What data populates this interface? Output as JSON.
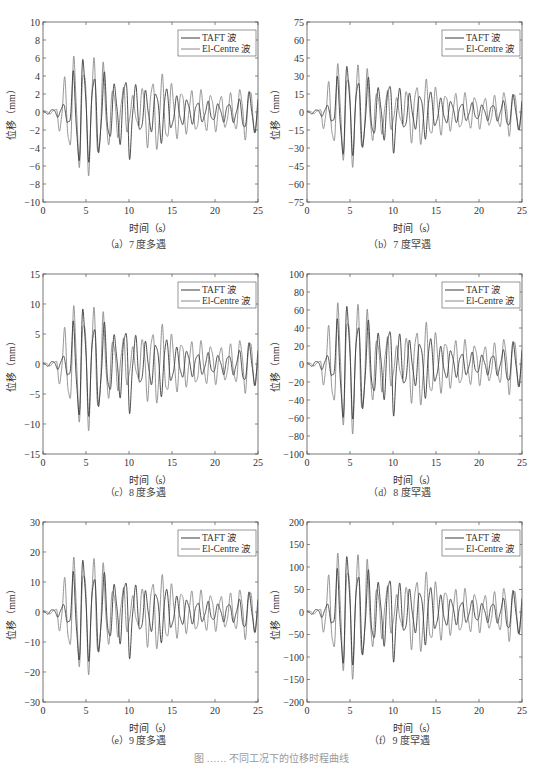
{
  "figure": {
    "caption_partial": "图 ……  不同工况下的位移时程曲线"
  },
  "colors": {
    "taft": "#3a3a3a",
    "elcentro": "#8a8a8a",
    "axis": "#555555",
    "text": "#333333"
  },
  "chart_data": [
    {
      "id": "a",
      "type": "line",
      "caption": "（a）7 度多遇",
      "xlabel": "时间（s）",
      "ylabel": "位移（mm）",
      "xlim": [
        0,
        25
      ],
      "ylim": [
        -10,
        10
      ],
      "xticks": [
        0,
        5,
        10,
        15,
        20,
        25
      ],
      "yticks": [
        -10,
        -8,
        -6,
        -4,
        -2,
        0,
        2,
        4,
        6,
        8,
        10
      ],
      "legend": [
        "TAFT 波",
        "El-Centre 波"
      ],
      "legend_position": "upper right",
      "grid": false,
      "scale": 8.3
    },
    {
      "id": "b",
      "type": "line",
      "caption": "（b）7 度罕遇",
      "xlabel": "时间（s）",
      "ylabel": "位移（mm）",
      "xlim": [
        0,
        25
      ],
      "ylim": [
        -75,
        75
      ],
      "xticks": [
        0,
        5,
        10,
        15,
        20,
        25
      ],
      "yticks": [
        -75,
        -60,
        -45,
        -30,
        -15,
        0,
        15,
        30,
        45,
        60,
        75
      ],
      "legend": [
        "TAFT 波",
        "El-Centre 波"
      ],
      "legend_position": "upper right",
      "grid": false,
      "scale": 54
    },
    {
      "id": "c",
      "type": "line",
      "caption": "（c）8 度多遇",
      "xlabel": "时间（s）",
      "ylabel": "位移（mm）",
      "xlim": [
        0,
        25
      ],
      "ylim": [
        -15,
        15
      ],
      "xticks": [
        0,
        5,
        10,
        15,
        20,
        25
      ],
      "yticks": [
        -15,
        -10,
        -5,
        0,
        5,
        10,
        15
      ],
      "legend": [
        "TAFT 波",
        "El-Centre 波"
      ],
      "legend_position": "upper right",
      "grid": false,
      "scale": 13
    },
    {
      "id": "d",
      "type": "line",
      "caption": "（d）8 度罕遇",
      "xlabel": "时间（s）",
      "ylabel": "位移（mm）",
      "xlim": [
        0,
        25
      ],
      "ylim": [
        -100,
        100
      ],
      "xticks": [
        0,
        5,
        10,
        15,
        20,
        25
      ],
      "yticks": [
        -100,
        -80,
        -60,
        -40,
        -20,
        0,
        20,
        40,
        60,
        80,
        100
      ],
      "legend": [
        "TAFT 波",
        "El-Centre 波"
      ],
      "legend_position": "upper right",
      "grid": false,
      "scale": 91
    },
    {
      "id": "e",
      "type": "line",
      "caption": "（e）9 度多遇",
      "xlabel": "时间（s）",
      "ylabel": "位移（mm）",
      "xlim": [
        0,
        25
      ],
      "ylim": [
        -30,
        30
      ],
      "xticks": [
        0,
        5,
        10,
        15,
        20,
        25
      ],
      "yticks": [
        -30,
        -20,
        -10,
        0,
        10,
        20,
        30
      ],
      "legend": [
        "TAFT 波",
        "El-Centre 波"
      ],
      "legend_position": "upper right",
      "grid": false,
      "scale": 24.5
    },
    {
      "id": "f",
      "type": "line",
      "caption": "（f）9 度罕遇",
      "xlabel": "时间（s）",
      "ylabel": "位移（mm）",
      "xlim": [
        0,
        25
      ],
      "ylim": [
        -200,
        200
      ],
      "xticks": [
        0,
        5,
        10,
        15,
        20,
        25
      ],
      "yticks": [
        -200,
        -150,
        -100,
        -50,
        0,
        50,
        100,
        150,
        200
      ],
      "legend": [
        "TAFT 波",
        "El-Centre 波"
      ],
      "legend_position": "upper right",
      "grid": false,
      "scale": 175
    }
  ],
  "series_shape": {
    "note": "normalized displacement envelopes (peak = 1) shared by all panels, scaled by chart_data[i].scale",
    "x": [
      0,
      0.5,
      1,
      1.5,
      2,
      2.5,
      3,
      3.5,
      4,
      4.5,
      5,
      5.5,
      6,
      6.5,
      7,
      7.5,
      8,
      8.5,
      9,
      9.5,
      10,
      10.5,
      11,
      11.5,
      12,
      12.5,
      13,
      13.5,
      14,
      14.5,
      15,
      15.5,
      16,
      16.5,
      17,
      17.5,
      18,
      18.5,
      19,
      19.5,
      20,
      20.5,
      21,
      21.5,
      22,
      22.5,
      23,
      23.5,
      24,
      24.5,
      25
    ],
    "taft_envelope": [
      0.02,
      0.03,
      0.04,
      0.05,
      0.1,
      0.12,
      0.2,
      0.55,
      0.7,
      0.88,
      0.7,
      0.66,
      0.55,
      0.62,
      0.58,
      0.45,
      0.42,
      0.4,
      0.45,
      0.5,
      0.72,
      0.42,
      0.36,
      0.3,
      0.3,
      0.28,
      0.32,
      0.3,
      0.55,
      0.3,
      0.25,
      0.22,
      0.2,
      0.2,
      0.18,
      0.16,
      0.15,
      0.15,
      0.14,
      0.16,
      0.12,
      0.12,
      0.14,
      0.13,
      0.15,
      0.15,
      0.2,
      0.3,
      0.28,
      0.3,
      0.3
    ],
    "elcentro_envelope": [
      0.02,
      0.02,
      0.03,
      0.04,
      0.35,
      0.48,
      0.55,
      0.78,
      0.84,
      0.7,
      0.7,
      1.0,
      0.75,
      0.7,
      0.68,
      0.55,
      0.35,
      0.38,
      0.3,
      0.42,
      0.25,
      0.22,
      0.2,
      0.35,
      0.5,
      0.45,
      0.52,
      0.58,
      0.5,
      0.45,
      0.4,
      0.38,
      0.35,
      0.3,
      0.32,
      0.3,
      0.32,
      0.3,
      0.28,
      0.28,
      0.27,
      0.25,
      0.24,
      0.26,
      0.26,
      0.28,
      0.36,
      0.38,
      0.36,
      0.3,
      0.32
    ]
  }
}
